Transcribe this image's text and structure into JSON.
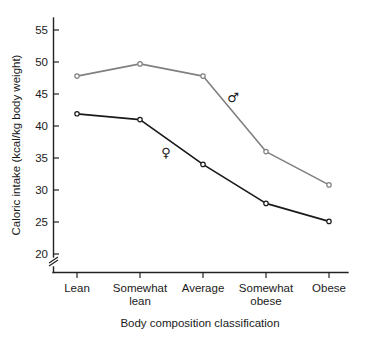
{
  "chart_data": {
    "type": "line",
    "title": "",
    "xlabel": "Body composition classification",
    "ylabel": "Caloric intake (kcal/kg body weight)",
    "categories": [
      "Lean",
      "Somewhat lean",
      "Average",
      "Somewhat obese",
      "Obese"
    ],
    "category_labels_wrapped": [
      [
        "Lean",
        ""
      ],
      [
        "Somewhat",
        "lean"
      ],
      [
        "Average",
        ""
      ],
      [
        "Somewhat",
        "obese"
      ],
      [
        "Obese",
        ""
      ]
    ],
    "series": [
      {
        "name": "male",
        "symbol": "♂",
        "color": "#808080",
        "values": [
          47.8,
          49.7,
          47.8,
          36.0,
          30.8
        ]
      },
      {
        "name": "female",
        "symbol": "♀",
        "color": "#1a1a1a",
        "values": [
          41.9,
          41.0,
          34.0,
          27.9,
          25.1
        ]
      }
    ],
    "ylim": [
      20,
      57
    ],
    "yticks": [
      20,
      25,
      30,
      35,
      40,
      45,
      50,
      55
    ],
    "ytick_labels": [
      "20",
      "25",
      "30",
      "35",
      "40",
      "45",
      "50",
      "55"
    ],
    "axis_break": true,
    "axis_break_note": "y-axis broken below 20",
    "grid": false,
    "legend": "inline-symbols"
  },
  "labels": {
    "y_axis_title": "Caloric intake (kcal/kg body weight)",
    "x_axis_title": "Body composition classification",
    "male_symbol": "♂",
    "female_symbol": "♀",
    "ytick_20": "20",
    "ytick_25": "25",
    "ytick_30": "30",
    "ytick_35": "35",
    "ytick_40": "40",
    "ytick_45": "45",
    "ytick_50": "50",
    "ytick_55": "55",
    "xtick_0_line1": "Lean",
    "xtick_1_line1": "Somewhat",
    "xtick_1_line2": "lean",
    "xtick_2_line1": "Average",
    "xtick_3_line1": "Somewhat",
    "xtick_3_line2": "obese",
    "xtick_4_line1": "Obese"
  },
  "colors": {
    "male_line": "#808080",
    "female_line": "#1a1a1a",
    "axis": "#222222",
    "background": "#ffffff"
  }
}
